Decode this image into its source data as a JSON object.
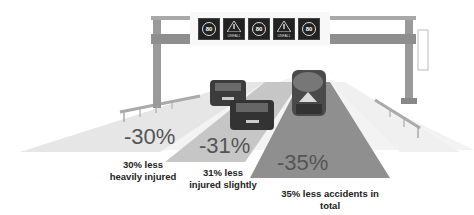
{
  "gantry": {
    "signs": [
      {
        "type": "speed-limit",
        "value": "80"
      },
      {
        "type": "warning",
        "value": "!",
        "text": "UNFALL"
      },
      {
        "type": "speed-limit",
        "value": "80"
      },
      {
        "type": "warning",
        "value": "!",
        "text": "UNFALL"
      },
      {
        "type": "speed-limit",
        "value": "80"
      }
    ]
  },
  "lanes": [
    {
      "percent": "-30%",
      "caption_line1": "30% less",
      "caption_line2": "heavily injured",
      "shade": "#e6e6e6"
    },
    {
      "percent": "-31%",
      "caption_line1": "31% less",
      "caption_line2": "injured slightly",
      "shade": "#c4c4c4"
    },
    {
      "percent": "-35%",
      "caption_line1": "35% less accidents in",
      "caption_line2": "total",
      "shade": "#8f8f8f"
    }
  ]
}
